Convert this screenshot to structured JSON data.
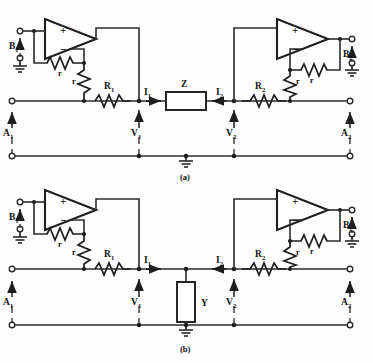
{
  "figure": {
    "type": "electronic-circuit-schematic",
    "background_color": "#fdfdfd",
    "ink_color": "#1d1d1d"
  },
  "panels": [
    {
      "id": "a",
      "caption": "(a)",
      "center_element": {
        "label": "Z",
        "kind": "series-box"
      },
      "terminals": {
        "left_top": "B",
        "left_top_sub": "1",
        "left_mid": "A",
        "left_mid_sub": "1",
        "right_top": "B",
        "right_top_sub": "2",
        "right_mid": "A",
        "right_mid_sub": "2"
      },
      "resistors": {
        "left_feedback": "r",
        "left_shunt": "r",
        "left_series": "R",
        "left_series_sub": "1",
        "right_feedback": "r",
        "right_shunt": "r",
        "right_series": "R",
        "right_series_sub": "2"
      },
      "currents": [
        {
          "label": "I",
          "sub": "1",
          "direction": "right"
        },
        {
          "label": "I",
          "sub": "2",
          "direction": "left"
        }
      ],
      "voltages": [
        {
          "label": "V",
          "sub": "1"
        },
        {
          "label": "V",
          "sub": "2"
        }
      ],
      "opamp_signs": {
        "plus": "+",
        "minus": "−"
      }
    },
    {
      "id": "b",
      "caption": "(b)",
      "center_element": {
        "label": "Y",
        "kind": "shunt-box"
      },
      "terminals": {
        "left_top": "B",
        "left_top_sub": "1",
        "left_mid": "A",
        "left_mid_sub": "1",
        "right_top": "B",
        "right_top_sub": "2",
        "right_mid": "A",
        "right_mid_sub": "2"
      },
      "resistors": {
        "left_feedback": "r",
        "left_shunt": "r",
        "left_series": "R",
        "left_series_sub": "1",
        "right_feedback": "r",
        "right_shunt": "r",
        "right_series": "R",
        "right_series_sub": "2"
      },
      "currents": [
        {
          "label": "I",
          "sub": "1",
          "direction": "right"
        },
        {
          "label": "I",
          "sub": "2",
          "direction": "left"
        }
      ],
      "voltages": [
        {
          "label": "V",
          "sub": "1"
        },
        {
          "label": "V",
          "sub": "2"
        }
      ],
      "opamp_signs": {
        "plus": "+",
        "minus": "−"
      }
    }
  ]
}
